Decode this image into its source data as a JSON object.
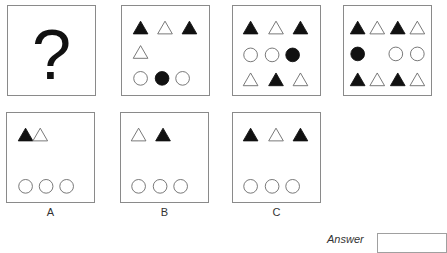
{
  "puzzle": {
    "question_box": {
      "symbol": "?"
    },
    "sequence": [
      {
        "id": "seq-1",
        "shapes": [
          {
            "type": "triangle",
            "fill": "black",
            "x": 19,
            "y": 22
          },
          {
            "type": "triangle",
            "fill": "white",
            "x": 44,
            "y": 22
          },
          {
            "type": "triangle",
            "fill": "black",
            "x": 69,
            "y": 22
          },
          {
            "type": "triangle",
            "fill": "white",
            "x": 19,
            "y": 47
          },
          {
            "type": "circle",
            "fill": "white",
            "x": 19,
            "y": 74
          },
          {
            "type": "circle",
            "fill": "black",
            "x": 41,
            "y": 74
          },
          {
            "type": "circle",
            "fill": "white",
            "x": 62,
            "y": 74
          }
        ]
      },
      {
        "id": "seq-2",
        "shapes": [
          {
            "type": "triangle",
            "fill": "black",
            "x": 18,
            "y": 22
          },
          {
            "type": "triangle",
            "fill": "white",
            "x": 44,
            "y": 22
          },
          {
            "type": "triangle",
            "fill": "black",
            "x": 69,
            "y": 22
          },
          {
            "type": "circle",
            "fill": "white",
            "x": 18,
            "y": 50
          },
          {
            "type": "circle",
            "fill": "white",
            "x": 40,
            "y": 50
          },
          {
            "type": "circle",
            "fill": "black",
            "x": 61,
            "y": 50
          },
          {
            "type": "triangle",
            "fill": "white",
            "x": 18,
            "y": 75
          },
          {
            "type": "triangle",
            "fill": "black",
            "x": 44,
            "y": 75
          },
          {
            "type": "triangle",
            "fill": "white",
            "x": 69,
            "y": 75
          }
        ]
      },
      {
        "id": "seq-3",
        "shapes": [
          {
            "type": "triangle",
            "fill": "black",
            "x": 14,
            "y": 22
          },
          {
            "type": "triangle",
            "fill": "white",
            "x": 34,
            "y": 22
          },
          {
            "type": "triangle",
            "fill": "black",
            "x": 55,
            "y": 22
          },
          {
            "type": "triangle",
            "fill": "white",
            "x": 75,
            "y": 22
          },
          {
            "type": "circle",
            "fill": "black",
            "x": 14,
            "y": 49
          },
          {
            "type": "circle",
            "fill": "white",
            "x": 53,
            "y": 49
          },
          {
            "type": "circle",
            "fill": "white",
            "x": 75,
            "y": 49
          },
          {
            "type": "triangle",
            "fill": "black",
            "x": 14,
            "y": 75
          },
          {
            "type": "triangle",
            "fill": "white",
            "x": 34,
            "y": 75
          },
          {
            "type": "triangle",
            "fill": "black",
            "x": 55,
            "y": 75
          },
          {
            "type": "triangle",
            "fill": "white",
            "x": 75,
            "y": 75
          }
        ]
      }
    ],
    "options": [
      {
        "label": "A",
        "shapes": [
          {
            "type": "triangle",
            "fill": "black",
            "x": 19,
            "y": 22
          },
          {
            "type": "triangle",
            "fill": "white",
            "x": 34,
            "y": 22
          },
          {
            "type": "circle",
            "fill": "white",
            "x": 19,
            "y": 75
          },
          {
            "type": "circle",
            "fill": "white",
            "x": 40,
            "y": 75
          },
          {
            "type": "circle",
            "fill": "white",
            "x": 61,
            "y": 75
          }
        ]
      },
      {
        "label": "B",
        "shapes": [
          {
            "type": "triangle",
            "fill": "white",
            "x": 18,
            "y": 22
          },
          {
            "type": "triangle",
            "fill": "black",
            "x": 43,
            "y": 22
          },
          {
            "type": "circle",
            "fill": "white",
            "x": 18,
            "y": 75
          },
          {
            "type": "circle",
            "fill": "white",
            "x": 40,
            "y": 75
          },
          {
            "type": "circle",
            "fill": "white",
            "x": 61,
            "y": 75
          }
        ]
      },
      {
        "label": "C",
        "shapes": [
          {
            "type": "triangle",
            "fill": "black",
            "x": 18,
            "y": 22
          },
          {
            "type": "triangle",
            "fill": "white",
            "x": 44,
            "y": 22
          },
          {
            "type": "triangle",
            "fill": "black",
            "x": 69,
            "y": 22
          },
          {
            "type": "circle",
            "fill": "white",
            "x": 18,
            "y": 75
          },
          {
            "type": "circle",
            "fill": "white",
            "x": 40,
            "y": 75
          },
          {
            "type": "circle",
            "fill": "white",
            "x": 61,
            "y": 75
          }
        ]
      }
    ],
    "answer": {
      "label": "Answer",
      "value": ""
    }
  }
}
